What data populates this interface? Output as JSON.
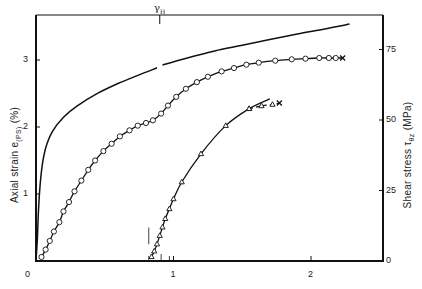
{
  "chart_data": {
    "type": "line",
    "title": "",
    "xlabel": "",
    "ylabel_left": "Axial strain e(PS) (%)",
    "ylabel_right": "Shear stress τθz (MPa)",
    "xlim": [
      0,
      2.5
    ],
    "ylim_left": [
      0,
      3.6
    ],
    "ylim_right": [
      0,
      88
    ],
    "x_ticks": [
      0,
      1,
      2
    ],
    "y_left_ticks": [
      0,
      1,
      2,
      3
    ],
    "y_right_ticks": [
      0,
      25,
      50,
      75
    ],
    "grid": false,
    "annotations": [
      {
        "text": "γH",
        "x": 0.9,
        "position": "top axis tick"
      }
    ],
    "series": [
      {
        "name": "Shear stress (solid line, no markers)",
        "axis": "right",
        "style": "solid",
        "marker": "none",
        "segments": [
          [
            [
              0.0,
              0
            ],
            [
              0.01,
              8
            ],
            [
              0.02,
              20
            ],
            [
              0.04,
              32
            ],
            [
              0.07,
              40
            ],
            [
              0.12,
              46
            ],
            [
              0.2,
              51
            ],
            [
              0.3,
              55
            ],
            [
              0.45,
              59.5
            ],
            [
              0.6,
              63
            ],
            [
              0.75,
              66
            ],
            [
              0.88,
              68.5
            ]
          ],
          [
            [
              0.92,
              69.5
            ],
            [
              1.1,
              72
            ],
            [
              1.3,
              74.5
            ],
            [
              1.5,
              76.5
            ],
            [
              1.7,
              78.5
            ],
            [
              1.9,
              80.5
            ],
            [
              2.1,
              82.3
            ],
            [
              2.28,
              84
            ]
          ]
        ]
      },
      {
        "name": "Axial strain, first loading (circles)",
        "axis": "left",
        "style": "solid",
        "marker": "circle",
        "end_marker": "x",
        "points": [
          [
            0.04,
            0.06
          ],
          [
            0.07,
            0.17
          ],
          [
            0.1,
            0.3
          ],
          [
            0.13,
            0.44
          ],
          [
            0.17,
            0.58
          ],
          [
            0.2,
            0.74
          ],
          [
            0.24,
            0.88
          ],
          [
            0.28,
            1.04
          ],
          [
            0.33,
            1.2
          ],
          [
            0.38,
            1.36
          ],
          [
            0.43,
            1.5
          ],
          [
            0.49,
            1.64
          ],
          [
            0.55,
            1.75
          ],
          [
            0.61,
            1.86
          ],
          [
            0.68,
            1.95
          ],
          [
            0.74,
            2.02
          ],
          [
            0.8,
            2.06
          ],
          [
            0.85,
            2.1
          ],
          [
            0.91,
            2.2
          ],
          [
            0.96,
            2.32
          ],
          [
            1.02,
            2.45
          ],
          [
            1.09,
            2.57
          ],
          [
            1.17,
            2.67
          ],
          [
            1.25,
            2.75
          ],
          [
            1.35,
            2.83
          ],
          [
            1.44,
            2.88
          ],
          [
            1.53,
            2.93
          ],
          [
            1.62,
            2.96
          ],
          [
            1.74,
            2.99
          ],
          [
            1.86,
            3.01
          ],
          [
            1.96,
            3.02
          ],
          [
            2.06,
            3.03
          ],
          [
            2.13,
            3.03
          ],
          [
            2.18,
            3.03
          ]
        ],
        "end": [
          2.23,
          3.03
        ]
      },
      {
        "name": "Shear stress, reloading (triangles, solid)",
        "axis": "right",
        "style": "solid",
        "marker": "triangle",
        "points": [
          [
            0.84,
            1.5
          ],
          [
            0.86,
            3.5
          ],
          [
            0.88,
            6
          ],
          [
            0.9,
            9
          ],
          [
            0.92,
            12
          ],
          [
            0.94,
            15
          ],
          [
            0.97,
            18.5
          ],
          [
            1.0,
            22
          ],
          [
            1.06,
            28
          ],
          [
            1.2,
            38
          ],
          [
            1.38,
            48
          ],
          [
            1.55,
            54
          ]
        ],
        "curve_end": [
          1.7,
          57.5
        ]
      },
      {
        "name": "Shear stress, reloading tail (triangles, dashed)",
        "axis": "right",
        "style": "dashed",
        "marker": "triangle",
        "end_marker": "x",
        "points": [
          [
            1.55,
            54
          ],
          [
            1.64,
            55
          ],
          [
            1.72,
            55.5
          ]
        ],
        "end": [
          1.77,
          56
        ]
      }
    ],
    "markers_on_x_axis": [
      0.82,
      0.91,
      0.97
    ],
    "vertical_reference_marks": [
      {
        "x": 0.82,
        "y_left": [
          0.25,
          0.5
        ]
      }
    ]
  },
  "axes": {
    "x_tick_labels": [
      "0",
      "1",
      "2"
    ],
    "y_left_tick_labels": [
      "0",
      "1",
      "2",
      "3"
    ],
    "y_right_tick_labels": [
      "0",
      "25",
      "50",
      "75"
    ],
    "y_left_title": "Axial strain e",
    "y_left_title_sub": "(PS)",
    "y_left_title_unit": "(%)",
    "y_right_title": "Shear stress τ",
    "y_right_title_sub": "θz",
    "y_right_title_unit": "(MPa)",
    "top_annotation": "γ",
    "top_annotation_sub": "H"
  }
}
